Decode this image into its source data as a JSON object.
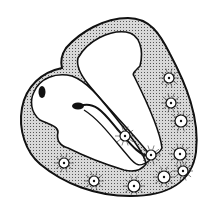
{
  "diagram": {
    "colors": {
      "background": "#ffffff",
      "outline": "#111111",
      "wall_fill": "#bdbdbd",
      "chamber": "#ffffff"
    },
    "nodes": [
      {
        "x": 169,
        "y": 78,
        "r": 5
      },
      {
        "x": 171,
        "y": 103,
        "r": 5
      },
      {
        "x": 181,
        "y": 121,
        "r": 6
      },
      {
        "x": 125,
        "y": 136,
        "r": 5
      },
      {
        "x": 151,
        "y": 155,
        "r": 5
      },
      {
        "x": 180,
        "y": 154,
        "r": 6
      },
      {
        "x": 183,
        "y": 171,
        "r": 5
      },
      {
        "x": 164,
        "y": 177,
        "r": 6
      },
      {
        "x": 134,
        "y": 186,
        "r": 6
      },
      {
        "x": 94,
        "y": 181,
        "r": 5
      },
      {
        "x": 64,
        "y": 163,
        "r": 5
      }
    ]
  }
}
